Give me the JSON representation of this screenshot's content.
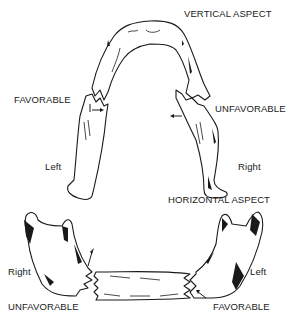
{
  "figure": {
    "vertical": {
      "title": "VERTICAL ASPECT",
      "left_fracture_label": "FAVORABLE",
      "right_fracture_label": "UNFAVORABLE",
      "left_side_label": "Left",
      "right_side_label": "Right"
    },
    "horizontal": {
      "title": "HORIZONTAL ASPECT",
      "left_side_label": "Right",
      "right_side_label": "Left",
      "left_fracture_label": "UNFAVORABLE",
      "right_fracture_label": "FAVORABLE"
    },
    "colors": {
      "ink": "#1a1a1a",
      "background": "#ffffff"
    }
  }
}
